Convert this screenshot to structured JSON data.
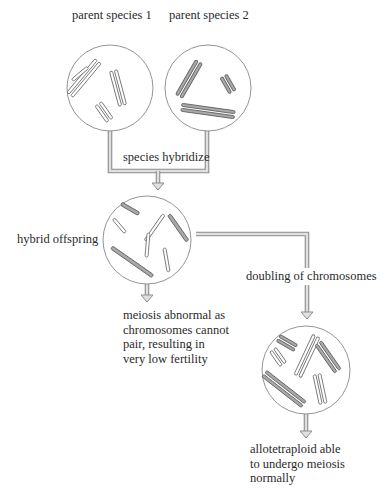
{
  "diagram": {
    "nodes": {
      "parent1": {
        "label": "parent species 1",
        "chromosome_style": "white"
      },
      "parent2": {
        "label": "parent species 2",
        "chromosome_style": "gray"
      },
      "hybrid": {
        "label": "hybrid offspring",
        "chromosome_style": "mixed"
      },
      "allotetraploid": {
        "label": "allotetraploid able to undergo meiosis normally",
        "lines": [
          "allotetraploid able",
          "to undergo meiosis",
          "normally"
        ]
      }
    },
    "edges": [
      {
        "from": "parent1+parent2",
        "to": "hybrid",
        "label": "species hybridize"
      },
      {
        "from": "hybrid",
        "to": "outcome_sterile",
        "label": ""
      },
      {
        "from": "hybrid",
        "to": "allotetraploid",
        "label": "doubling of chromosomes"
      }
    ],
    "outcome_sterile": {
      "lines": [
        "meiosis abnormal as",
        "chromosomes cannot",
        "pair, resulting in",
        "very low fertility"
      ]
    },
    "colors": {
      "line": "#8d8d8d",
      "arrow_fill": "#e0e0e0",
      "gray_chromosome": "#a9a9a9",
      "circle_stroke": "#888888"
    }
  }
}
